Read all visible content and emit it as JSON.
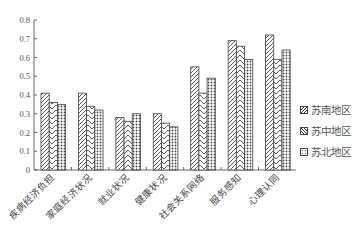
{
  "chart_data": {
    "type": "bar",
    "title": "",
    "xlabel": "",
    "ylabel": "",
    "ylim": [
      0,
      0.8
    ],
    "yticks": [
      "0",
      "0.1",
      "0.2",
      "0.3",
      "0.4",
      "0.5",
      "0.6",
      "0.7",
      "0.8"
    ],
    "grid": false,
    "legend_position": "right",
    "categories": [
      "疾病经济负担",
      "家庭经济状况",
      "就业状况",
      "健康状况",
      "社会关系网络",
      "服务感知",
      "心理认同"
    ],
    "series": [
      {
        "name": "苏南地区",
        "pattern": "diagonal",
        "values": [
          0.41,
          0.41,
          0.28,
          0.3,
          0.55,
          0.69,
          0.72
        ]
      },
      {
        "name": "苏中地区",
        "pattern": "chevron",
        "values": [
          0.36,
          0.34,
          0.26,
          0.25,
          0.41,
          0.66,
          0.59
        ]
      },
      {
        "name": "苏北地区",
        "pattern": "crosshatch",
        "values": [
          0.35,
          0.32,
          0.3,
          0.23,
          0.49,
          0.59,
          0.64
        ]
      }
    ]
  },
  "legend": {
    "items": [
      "苏南地区",
      "苏中地区",
      "苏北地区"
    ]
  }
}
